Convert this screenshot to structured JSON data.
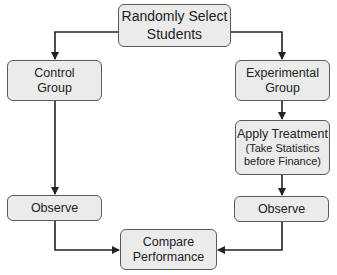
{
  "diagram": {
    "type": "flowchart",
    "nodes": {
      "top": {
        "line1": "Randomly Select",
        "line2": "Students"
      },
      "control": {
        "line1": "Control",
        "line2": "Group"
      },
      "experimental": {
        "line1": "Experimental",
        "line2": "Group"
      },
      "treatment": {
        "line1": "Apply Treatment",
        "line2": "(Take Statistics",
        "line3": "before Finance)"
      },
      "observe_left": {
        "label": "Observe"
      },
      "observe_right": {
        "label": "Observe"
      },
      "compare": {
        "line1": "Compare",
        "line2": "Performance"
      }
    },
    "edges": [
      {
        "from": "Randomly Select Students",
        "to": "Control Group"
      },
      {
        "from": "Randomly Select Students",
        "to": "Experimental Group"
      },
      {
        "from": "Experimental Group",
        "to": "Apply Treatment"
      },
      {
        "from": "Apply Treatment",
        "to": "Observe (experimental)"
      },
      {
        "from": "Control Group",
        "to": "Observe (control)"
      },
      {
        "from": "Observe (control)",
        "to": "Compare Performance"
      },
      {
        "from": "Observe (experimental)",
        "to": "Compare Performance"
      }
    ],
    "colors": {
      "node_fill": "#ebebeb",
      "node_border": "#5a5a5a",
      "line": "#222222",
      "text": "#222222"
    }
  }
}
